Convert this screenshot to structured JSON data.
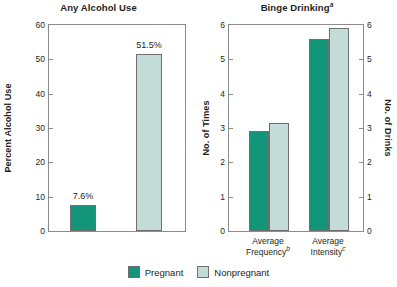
{
  "chart_data": [
    {
      "type": "bar",
      "id": "any-alcohol-use",
      "title": "Any Alcohol Use",
      "title_superscript": "",
      "xlabel": "",
      "ylabel": "Percent Alcohol Use",
      "ylim": [
        0,
        60
      ],
      "yticks": [
        0,
        10,
        20,
        30,
        40,
        50,
        60
      ],
      "grid": false,
      "categories": [
        "Pregnant",
        "Nonpregnant"
      ],
      "values": [
        7.6,
        51.5
      ],
      "data_labels": [
        "7.6%",
        "51.5%"
      ],
      "series": [
        {
          "name": "Pregnant",
          "values": [
            7.6
          ],
          "color": "#13957a"
        },
        {
          "name": "Nonpregnant",
          "values": [
            51.5
          ],
          "color": "#c3dcd7"
        }
      ]
    },
    {
      "type": "bar",
      "id": "binge-drinking",
      "title": "Binge Drinking",
      "title_superscript": "a",
      "xlabel": "",
      "ylabel": "No. of Times",
      "ylabel_secondary": "No. of Drinks",
      "ylim": [
        0,
        6
      ],
      "yticks": [
        0,
        1,
        2,
        3,
        4,
        5,
        6
      ],
      "yticks_secondary": [
        0,
        1,
        2,
        3,
        4,
        5,
        6
      ],
      "grid": false,
      "categories": [
        "Average Frequency",
        "Average Intensity"
      ],
      "category_superscripts": [
        "b",
        "c"
      ],
      "series": [
        {
          "name": "Pregnant",
          "values": [
            2.9,
            5.6
          ],
          "color": "#13957a"
        },
        {
          "name": "Nonpregnant",
          "values": [
            3.15,
            5.9
          ],
          "color": "#c3dcd7"
        }
      ]
    }
  ],
  "legend": {
    "position": "bottom-center",
    "items": [
      {
        "label": "Pregnant",
        "color": "#13957a"
      },
      {
        "label": "Nonpregnant",
        "color": "#c3dcd7"
      }
    ]
  },
  "colors": {
    "pregnant": "#13957a",
    "nonpregnant": "#c3dcd7",
    "axis": "#8c8c8c",
    "text": "#231f20",
    "background": "#ffffff"
  }
}
